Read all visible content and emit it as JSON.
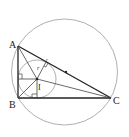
{
  "diagram": {
    "points": {
      "A": {
        "label": "A",
        "x": 18,
        "y": 46
      },
      "B": {
        "label": "B",
        "x": 18,
        "y": 98
      },
      "C": {
        "label": "C",
        "x": 111,
        "y": 98
      },
      "I": {
        "label": "I",
        "x": 37,
        "y": 79
      },
      "M": {
        "label": "",
        "x": 64.5,
        "y": 72
      }
    },
    "labels": {
      "A": "A",
      "B": "B",
      "C": "C",
      "I": "I",
      "r1": "r",
      "r2": "r"
    },
    "circumcircle": {
      "cx": 64.5,
      "cy": 72,
      "r": 53
    },
    "incircle": {
      "cx": 37,
      "cy": 79,
      "r": 19
    },
    "colors": {
      "triangle": "#222222",
      "circles": "#9a9a9a",
      "construction": "#444444"
    }
  }
}
